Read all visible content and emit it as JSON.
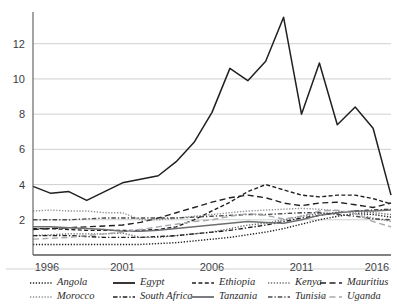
{
  "chart_data": {
    "type": "line",
    "title": "",
    "xlabel": "",
    "ylabel": "",
    "xlim": [
      1996,
      2016
    ],
    "ylim": [
      0,
      13.8
    ],
    "yticks": [
      2,
      4,
      6,
      8,
      10,
      12
    ],
    "xticks": [
      1996,
      2001,
      2006,
      2011,
      2016
    ],
    "grid": true,
    "legend_position": "bottom",
    "x": [
      1996,
      1997,
      1998,
      1999,
      2000,
      2001,
      2002,
      2003,
      2004,
      2005,
      2006,
      2007,
      2008,
      2009,
      2010,
      2011,
      2012,
      2013,
      2014,
      2015,
      2016
    ],
    "series": [
      {
        "name": "Angola",
        "style": "dotted",
        "color": "#231f20",
        "values": [
          0.6,
          0.6,
          0.6,
          0.6,
          0.6,
          0.6,
          0.6,
          0.65,
          0.7,
          0.8,
          0.9,
          1.0,
          1.15,
          1.3,
          1.5,
          1.75,
          2.0,
          2.2,
          2.35,
          2.3,
          2.15
        ]
      },
      {
        "name": "Egypt",
        "style": "solid",
        "color": "#231f20",
        "values": [
          3.9,
          3.5,
          3.6,
          3.1,
          3.6,
          4.1,
          4.3,
          4.5,
          5.3,
          6.4,
          8.1,
          10.6,
          9.9,
          11.0,
          13.5,
          8.0,
          10.9,
          7.4,
          8.4,
          7.2,
          3.4
        ]
      },
      {
        "name": "Ethiopia",
        "style": "dashed",
        "color": "#231f20",
        "values": [
          1.5,
          1.5,
          1.45,
          1.4,
          1.4,
          1.4,
          1.4,
          1.45,
          1.6,
          2.0,
          2.5,
          3.0,
          3.6,
          4.0,
          3.7,
          3.4,
          3.3,
          3.4,
          3.4,
          3.2,
          2.9
        ]
      },
      {
        "name": "Kenya",
        "style": "dotted",
        "color": "#6d6e71",
        "values": [
          1.1,
          1.15,
          1.2,
          1.2,
          1.2,
          1.25,
          1.0,
          1.0,
          1.1,
          1.2,
          1.3,
          1.5,
          1.7,
          1.8,
          2.0,
          2.2,
          2.35,
          2.4,
          2.45,
          2.4,
          2.3
        ]
      },
      {
        "name": "Mauritius",
        "style": "longdash",
        "color": "#231f20",
        "values": [
          1.45,
          1.5,
          1.55,
          1.6,
          1.65,
          1.7,
          1.85,
          2.1,
          2.4,
          2.7,
          3.0,
          3.25,
          3.4,
          3.25,
          2.95,
          2.8,
          2.95,
          3.0,
          2.85,
          2.7,
          2.95
        ]
      },
      {
        "name": "Morocco",
        "style": "dotted",
        "color": "#8d8f92",
        "values": [
          2.5,
          2.55,
          2.5,
          2.5,
          2.4,
          2.4,
          2.0,
          2.0,
          2.1,
          2.2,
          2.3,
          2.4,
          2.5,
          2.55,
          2.6,
          2.65,
          2.6,
          2.5,
          2.35,
          2.1,
          1.9
        ]
      },
      {
        "name": "South Africa",
        "style": "dashdot",
        "color": "#231f20",
        "values": [
          1.1,
          1.1,
          1.1,
          1.05,
          1.0,
          1.0,
          1.0,
          1.05,
          1.1,
          1.2,
          1.3,
          1.4,
          1.55,
          1.7,
          1.9,
          2.1,
          2.25,
          2.4,
          2.5,
          2.55,
          2.6
        ]
      },
      {
        "name": "Tanzania",
        "style": "solid",
        "color": "#6d6e71",
        "values": [
          1.6,
          1.6,
          1.55,
          1.5,
          1.45,
          1.35,
          1.35,
          1.4,
          1.5,
          1.6,
          1.7,
          1.8,
          1.9,
          1.85,
          1.8,
          2.0,
          2.25,
          2.4,
          2.5,
          2.5,
          2.55
        ]
      },
      {
        "name": "Tunisia",
        "style": "dashdot",
        "color": "#4a4a4c",
        "values": [
          2.0,
          2.0,
          2.0,
          2.05,
          2.1,
          2.1,
          2.1,
          2.1,
          2.1,
          2.15,
          2.2,
          2.25,
          2.3,
          2.3,
          2.35,
          2.4,
          2.4,
          2.3,
          2.2,
          2.05,
          2.0
        ]
      },
      {
        "name": "Uganda",
        "style": "longdash",
        "color": "#a7a9ac",
        "values": [
          0.9,
          0.95,
          1.0,
          1.1,
          1.2,
          1.3,
          1.45,
          1.6,
          1.75,
          1.9,
          2.0,
          2.2,
          2.35,
          2.25,
          2.05,
          2.2,
          2.5,
          2.55,
          2.35,
          1.9,
          1.6
        ]
      }
    ]
  },
  "legend": {
    "rows": [
      [
        {
          "name": "Angola",
          "style": "dotted",
          "color": "#231f20"
        },
        {
          "name": "Egypt",
          "style": "solid",
          "color": "#231f20"
        },
        {
          "name": "Ethiopia",
          "style": "dashed",
          "color": "#231f20"
        },
        {
          "name": "Kenya",
          "style": "dotted",
          "color": "#6d6e71"
        },
        {
          "name": "Mauritius",
          "style": "longdash",
          "color": "#231f20"
        }
      ],
      [
        {
          "name": "Morocco",
          "style": "dotted",
          "color": "#8d8f92"
        },
        {
          "name": "South Africa",
          "style": "dashdot",
          "color": "#231f20"
        },
        {
          "name": "Tanzania",
          "style": "solid",
          "color": "#6d6e71"
        },
        {
          "name": "Tunisia",
          "style": "dashdot",
          "color": "#4a4a4c"
        },
        {
          "name": "Uganda",
          "style": "longdash",
          "color": "#a7a9ac"
        }
      ]
    ]
  },
  "colors": {
    "grid": "#b9bbbd",
    "axis": "#58595b",
    "text": "#231f20"
  }
}
